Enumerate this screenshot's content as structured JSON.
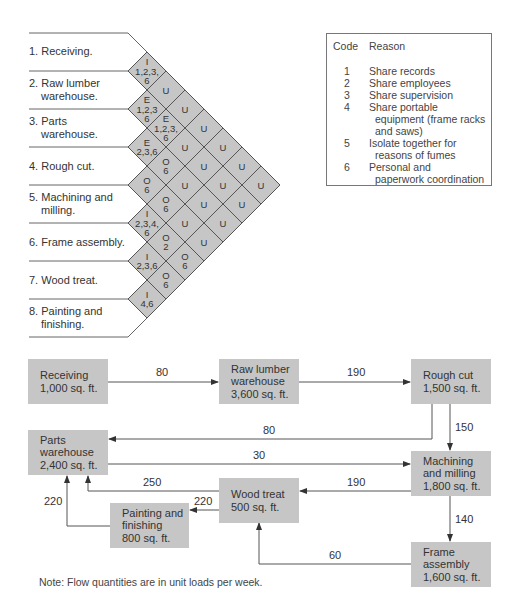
{
  "relationship_chart": {
    "departments": [
      {
        "num": "1.",
        "line1": "Receiving.",
        "line2": ""
      },
      {
        "num": "2.",
        "line1": "Raw lumber",
        "line2": "warehouse."
      },
      {
        "num": "3.",
        "line1": "Parts",
        "line2": "warehouse."
      },
      {
        "num": "4.",
        "line1": "Rough cut.",
        "line2": ""
      },
      {
        "num": "5.",
        "line1": "Machining and",
        "line2": "milling."
      },
      {
        "num": "6.",
        "line1": "Frame assembly.",
        "line2": ""
      },
      {
        "num": "7.",
        "line1": "Wood treat.",
        "line2": ""
      },
      {
        "num": "8.",
        "line1": "Painting and",
        "line2": "finishing."
      }
    ],
    "cells": [
      {
        "from": 1,
        "to": 2,
        "rating": "I",
        "reasons": [
          "1,2,3,",
          "6"
        ]
      },
      {
        "from": 1,
        "to": 3,
        "rating": "U",
        "reasons": []
      },
      {
        "from": 1,
        "to": 4,
        "rating": "U",
        "reasons": []
      },
      {
        "from": 1,
        "to": 5,
        "rating": "U",
        "reasons": []
      },
      {
        "from": 1,
        "to": 6,
        "rating": "U",
        "reasons": []
      },
      {
        "from": 1,
        "to": 7,
        "rating": "U",
        "reasons": []
      },
      {
        "from": 1,
        "to": 8,
        "rating": "U",
        "reasons": []
      },
      {
        "from": 2,
        "to": 3,
        "rating": "E",
        "reasons": [
          "1,2,3",
          "6"
        ]
      },
      {
        "from": 2,
        "to": 4,
        "rating": "E",
        "reasons": [
          "1,2,3,",
          "6"
        ]
      },
      {
        "from": 2,
        "to": 5,
        "rating": "U",
        "reasons": []
      },
      {
        "from": 2,
        "to": 6,
        "rating": "U",
        "reasons": []
      },
      {
        "from": 2,
        "to": 7,
        "rating": "U",
        "reasons": []
      },
      {
        "from": 2,
        "to": 8,
        "rating": "U",
        "reasons": []
      },
      {
        "from": 3,
        "to": 4,
        "rating": "E",
        "reasons": [
          "2,3,6"
        ]
      },
      {
        "from": 3,
        "to": 5,
        "rating": "O",
        "reasons": [
          "6"
        ]
      },
      {
        "from": 3,
        "to": 6,
        "rating": "U",
        "reasons": []
      },
      {
        "from": 3,
        "to": 7,
        "rating": "U",
        "reasons": []
      },
      {
        "from": 3,
        "to": 8,
        "rating": "U",
        "reasons": []
      },
      {
        "from": 4,
        "to": 5,
        "rating": "O",
        "reasons": [
          "6"
        ]
      },
      {
        "from": 4,
        "to": 6,
        "rating": "O",
        "reasons": [
          "6"
        ]
      },
      {
        "from": 4,
        "to": 7,
        "rating": "U",
        "reasons": []
      },
      {
        "from": 4,
        "to": 8,
        "rating": "U",
        "reasons": []
      },
      {
        "from": 5,
        "to": 6,
        "rating": "I",
        "reasons": [
          "2,3,4,",
          "6"
        ]
      },
      {
        "from": 5,
        "to": 7,
        "rating": "O",
        "reasons": [
          "2"
        ]
      },
      {
        "from": 5,
        "to": 8,
        "rating": "O",
        "reasons": [
          "6"
        ]
      },
      {
        "from": 6,
        "to": 7,
        "rating": "I",
        "reasons": [
          "2,3,6"
        ]
      },
      {
        "from": 6,
        "to": 8,
        "rating": "O",
        "reasons": [
          "6"
        ]
      },
      {
        "from": 7,
        "to": 8,
        "rating": "I",
        "reasons": [
          "4,6"
        ]
      }
    ]
  },
  "legend": {
    "code_header": "Code",
    "reason_header": "Reason",
    "rows": [
      {
        "code": "1",
        "reason": "Share records",
        "cont": ""
      },
      {
        "code": "2",
        "reason": "Share employees",
        "cont": ""
      },
      {
        "code": "3",
        "reason": "Share supervision",
        "cont": ""
      },
      {
        "code": "4",
        "reason": "Share portable",
        "cont": "equipment (frame racks and saws)"
      },
      {
        "code": "5",
        "reason": "Isolate together for",
        "cont": "reasons of fumes"
      },
      {
        "code": "6",
        "reason": "Personal and",
        "cont": "paperwork coordination"
      }
    ]
  },
  "flow_diagram": {
    "boxes": {
      "receiving": {
        "name": "Receiving",
        "area": "1,000 sq. ft."
      },
      "raw_lumber": {
        "name1": "Raw lumber",
        "name2": "warehouse",
        "area": "3,600 sq. ft."
      },
      "rough_cut": {
        "name": "Rough cut",
        "area": "1,500 sq. ft."
      },
      "parts_warehouse": {
        "name1": "Parts",
        "name2": "warehouse",
        "area": "2,400 sq. ft."
      },
      "machining": {
        "name1": "Machining",
        "name2": "and milling",
        "area": "1,800 sq. ft."
      },
      "wood_treat": {
        "name": "Wood treat",
        "area": "500 sq. ft."
      },
      "painting": {
        "name1": "Painting and",
        "name2": "finishing",
        "area": "800 sq. ft."
      },
      "frame_assembly": {
        "name1": "Frame",
        "name2": "assembly",
        "area": "1,600 sq. ft."
      }
    },
    "flows": {
      "receiving_to_raw": "80",
      "raw_to_rough": "190",
      "rough_to_parts": "80",
      "rough_to_machining": "150",
      "parts_to_machining": "30",
      "machining_to_wood": "190",
      "machining_to_frame": "140",
      "wood_to_parts": "250",
      "wood_to_painting": "220",
      "painting_to_parts": "220",
      "frame_to_wood": "60"
    },
    "note": "Note: Flow quantities are in unit loads per week."
  },
  "colors": {
    "cell_fill": "#c6c6c6",
    "box_fill": "#c6c6c6",
    "line": "#555555"
  }
}
